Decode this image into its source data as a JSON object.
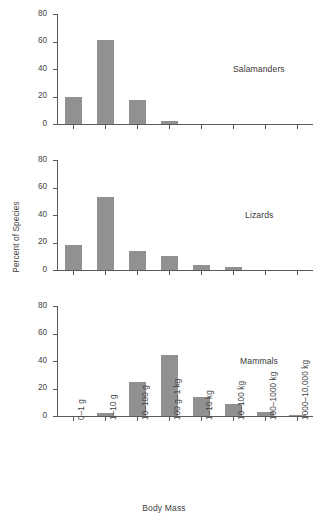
{
  "chart_data": {
    "type": "bar",
    "title": "",
    "xlabel": "Body Mass",
    "ylabel": "Percent of Species",
    "ylim": [
      0,
      80
    ],
    "yticks": [
      0,
      20,
      40,
      60,
      80
    ],
    "grid": false,
    "legend_position": "none",
    "categories": [
      "0–1 g",
      "1–10 g",
      "10–100 g",
      "100 g–1 kg",
      "1–10 kg",
      "10–100 kg",
      "100–1000 kg",
      "1000–10,000 kg"
    ],
    "panels": [
      {
        "name": "Salamanders",
        "values": [
          20.0,
          61.0,
          17.5,
          2.0,
          0,
          0,
          0,
          0
        ]
      },
      {
        "name": "Lizards",
        "values": [
          18.0,
          53.0,
          13.5,
          10.5,
          4.0,
          2.0,
          0,
          0
        ]
      },
      {
        "name": "Mammals",
        "values": [
          0,
          2.5,
          24.5,
          44.5,
          14.0,
          9.0,
          3.0,
          1.0
        ]
      }
    ],
    "series": [
      {
        "name": "Salamanders",
        "values": [
          20.0,
          61.0,
          17.5,
          2.0,
          0,
          0,
          0,
          0
        ]
      },
      {
        "name": "Lizards",
        "values": [
          18.0,
          53.0,
          13.5,
          10.5,
          4.0,
          2.0,
          0,
          0
        ]
      },
      {
        "name": "Mammals",
        "values": [
          0,
          2.5,
          24.5,
          44.5,
          14.0,
          9.0,
          3.0,
          1.0
        ]
      }
    ],
    "colors": {
      "bar": "#919191",
      "axis": "#5a5a5a",
      "text": "#3f3f3f",
      "background": "#ffffff"
    }
  }
}
